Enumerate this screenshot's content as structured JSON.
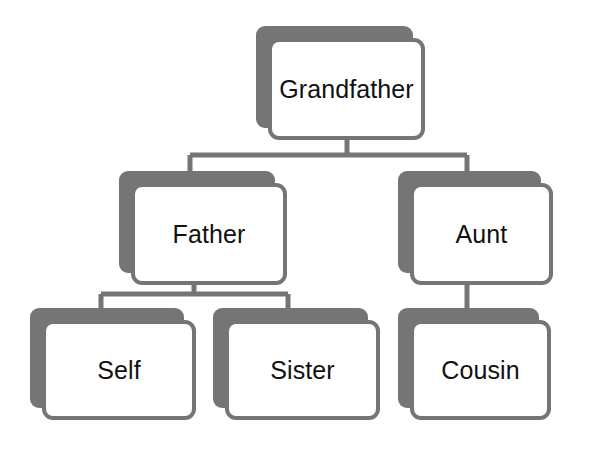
{
  "diagram": {
    "type": "family-tree",
    "canvas": {
      "width": 593,
      "height": 456
    },
    "colors": {
      "background": "#ffffff",
      "node_fill": "#ffffff",
      "node_border": "#757575",
      "node_shadow": "#757575",
      "connector": "#757575",
      "label_text": "#111111"
    },
    "nodes": [
      {
        "id": "grandfather",
        "label": "Grandfather",
        "tier": 1,
        "x": 256,
        "y": 26,
        "width": 157,
        "height": 102
      },
      {
        "id": "father",
        "label": "Father",
        "tier": 2,
        "x": 119,
        "y": 171,
        "width": 156,
        "height": 102
      },
      {
        "id": "aunt",
        "label": "Aunt",
        "tier": 2,
        "x": 398,
        "y": 171,
        "width": 143,
        "height": 102
      },
      {
        "id": "self",
        "label": "Self",
        "tier": 3,
        "x": 30,
        "y": 308,
        "width": 154,
        "height": 100
      },
      {
        "id": "sister",
        "label": "Sister",
        "tier": 3,
        "x": 213,
        "y": 308,
        "width": 155,
        "height": 100
      },
      {
        "id": "cousin",
        "label": "Cousin",
        "tier": 3,
        "x": 398,
        "y": 308,
        "width": 141,
        "height": 100
      }
    ],
    "edges": [
      {
        "id": "edge-grandfather-father",
        "from": "grandfather",
        "to": "father",
        "style": "elbow"
      },
      {
        "id": "edge-grandfather-aunt",
        "from": "grandfather",
        "to": "aunt",
        "style": "elbow"
      },
      {
        "id": "edge-father-self",
        "from": "father",
        "to": "self",
        "style": "elbow"
      },
      {
        "id": "edge-father-sister",
        "from": "father",
        "to": "sister",
        "style": "elbow"
      },
      {
        "id": "edge-aunt-cousin",
        "from": "aunt",
        "to": "cousin",
        "style": "straight"
      }
    ]
  }
}
